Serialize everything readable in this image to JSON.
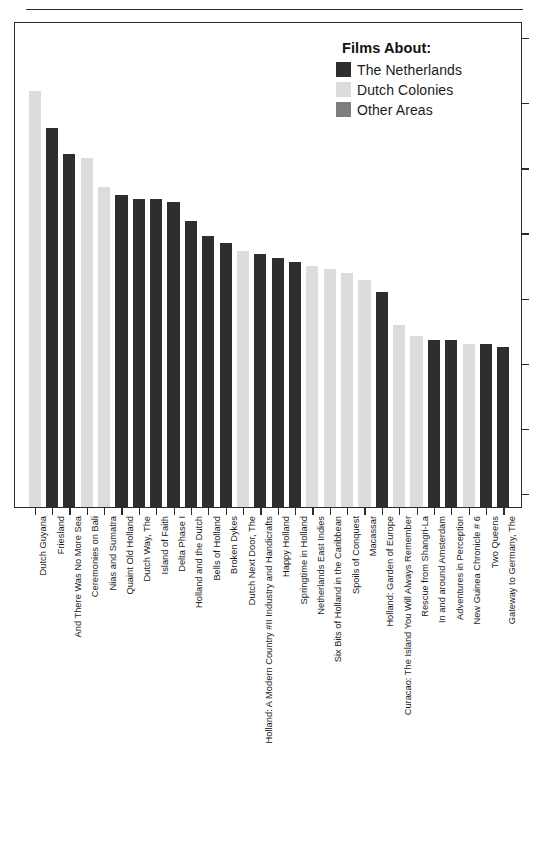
{
  "page": {
    "header_text": "",
    "width": 547,
    "height": 842
  },
  "legend": {
    "title": "Films About:",
    "entries": [
      {
        "label": "The Netherlands",
        "color": "#2e2e2e",
        "key": "netherlands"
      },
      {
        "label": "Dutch Colonies",
        "color": "#dcdcdc",
        "key": "colonies"
      },
      {
        "label": "Other Areas",
        "color": "#7d7d7d",
        "key": "other"
      }
    ]
  },
  "chart_data": {
    "type": "bar",
    "title": "",
    "xlabel": "",
    "ylabel": "",
    "grid": false,
    "legend_position": "top-right",
    "axis": {
      "y_ticks_count": 8,
      "y_tick_labels": [],
      "ylim": [
        0,
        130
      ],
      "x_axis_line": true,
      "y_axis_side": "right"
    },
    "series_key": "Films About:",
    "categories": [
      "Dutch Guyana",
      "Friesland",
      "And There Was No More Sea",
      "Ceremonies on Bali",
      "Nias and Sumatra",
      "Quaint Old Holland",
      "Dutch Way, The",
      "Island of Faith",
      "Delta Phase I",
      "Holland and the Dutch",
      "Bells of Holland",
      "Broken Dykes",
      "Dutch Next Door, The",
      "Holland: A Modern Country #II Industry and Handicrafts",
      "Happy Holland",
      "Springtime in Holland",
      "Netherlands East Indies",
      "Six Bits of Holland in the Caribbean",
      "Spoils of Conquest",
      "Macassar",
      "Holland: Garden of Europe",
      "Curacao: The Island You Will Always Remember",
      "Rescue from Shangri-La",
      "In and around Amsterdam",
      "Adventures in Perception",
      "New Guinea Chronicle # 6",
      "Two Queens",
      "Gateway to Germany, The"
    ],
    "values": [
      112,
      102,
      95,
      94,
      86,
      84,
      83,
      83,
      82,
      77,
      73,
      71,
      69,
      68,
      67,
      66,
      65,
      64,
      63,
      61,
      58,
      49,
      46,
      45,
      45,
      44,
      44,
      43
    ],
    "groups": [
      "colonies",
      "netherlands",
      "netherlands",
      "colonies",
      "colonies",
      "netherlands",
      "netherlands",
      "netherlands",
      "netherlands",
      "netherlands",
      "netherlands",
      "netherlands",
      "colonies",
      "netherlands",
      "netherlands",
      "netherlands",
      "colonies",
      "colonies",
      "colonies",
      "colonies",
      "netherlands",
      "colonies",
      "colonies",
      "netherlands",
      "netherlands",
      "colonies",
      "netherlands",
      "netherlands"
    ]
  }
}
